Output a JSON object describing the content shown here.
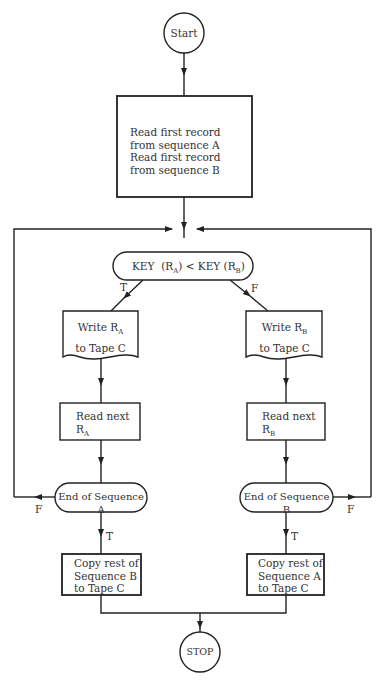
{
  "flowchart": {
    "start": {
      "label": "Start"
    },
    "init": {
      "lines": [
        "Read first record",
        "from sequence A",
        "Read first record",
        "from sequence B"
      ]
    },
    "decision": {
      "key_a": "KEY",
      "ra": "R",
      "ra_sub": "A",
      "op": "<",
      "key_b": "KEY",
      "rb": "R",
      "rb_sub": "B"
    },
    "branch_true_label": "T",
    "branch_false_label": "F",
    "write_a": {
      "line1": "Write R",
      "sub": "A",
      "line2": "to Tape C"
    },
    "write_b": {
      "line1": "Write R",
      "sub": "B",
      "line2": "to Tape C"
    },
    "read_a": {
      "line1": "Read next",
      "line2": "R",
      "sub": "A"
    },
    "read_b": {
      "line1": "Read next",
      "line2": "R",
      "sub": "B"
    },
    "end_a": {
      "label": "End of Sequence A",
      "false_label": "F",
      "true_label": "T"
    },
    "end_b": {
      "label": "End of Sequence B",
      "false_label": "F",
      "true_label": "T"
    },
    "copy_b": {
      "lines": [
        "Copy rest of",
        "Sequence B",
        "to Tape C"
      ]
    },
    "copy_a": {
      "lines": [
        "Copy rest of",
        "Sequence A",
        "to Tape C"
      ]
    },
    "stop": {
      "label": "STOP"
    }
  }
}
